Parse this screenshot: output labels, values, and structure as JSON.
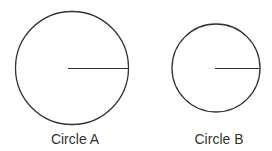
{
  "diagram": {
    "stroke_color": "#333333",
    "circles": [
      {
        "label": "Circle A",
        "cx": 72,
        "cy": 68,
        "r": 57
      },
      {
        "label": "Circle B",
        "cx": 216,
        "cy": 68,
        "r": 44
      }
    ]
  }
}
